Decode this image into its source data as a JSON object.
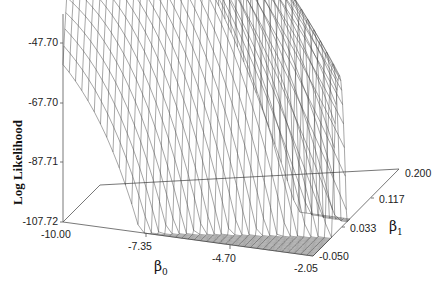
{
  "chart_data": {
    "type": "surface3d",
    "title": "",
    "zlabel": "Log Likelihood",
    "xlabel": "β0",
    "ylabel": "β1",
    "x_ticks": [
      "-10.00",
      "-7.35",
      "-4.70",
      "-2.05"
    ],
    "y_ticks": [
      "-0.050",
      "0.033",
      "0.117",
      "0.200"
    ],
    "z_ticks": [
      "-47.70",
      "-67.70",
      "-87.71",
      "-107.72"
    ],
    "xlim": [
      -10.0,
      -2.05
    ],
    "ylim": [
      -0.05,
      0.2
    ],
    "zlim": [
      -107.72,
      -27.69
    ],
    "grid": false,
    "surface": "wireframe",
    "line_color": "#3a3a3a"
  },
  "labels": {
    "z_title": "Log Likelihood",
    "x_symbol": "β",
    "x_sub": "0",
    "y_symbol": "β",
    "y_sub": "1"
  }
}
